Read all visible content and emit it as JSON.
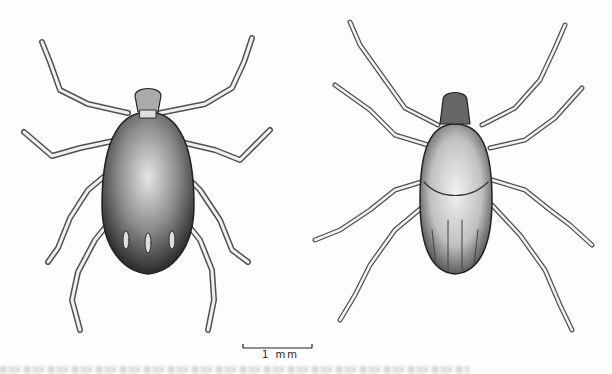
{
  "figure": {
    "specimens": [
      {
        "id": "tick-left",
        "view": "dorsal",
        "description": "Engorged-style tick, dark oval body with three pale posterior marks"
      },
      {
        "id": "tick-right",
        "view": "dorsal",
        "description": "Elongate tick with patterned scutum and grooved festoons"
      }
    ],
    "scale_bar": {
      "label": "1 mm"
    },
    "colors": {
      "ink": "#1e1e1e",
      "body_dark": "#555555",
      "body_light": "#c8c8c8",
      "paper": "#fdfdfd"
    }
  }
}
